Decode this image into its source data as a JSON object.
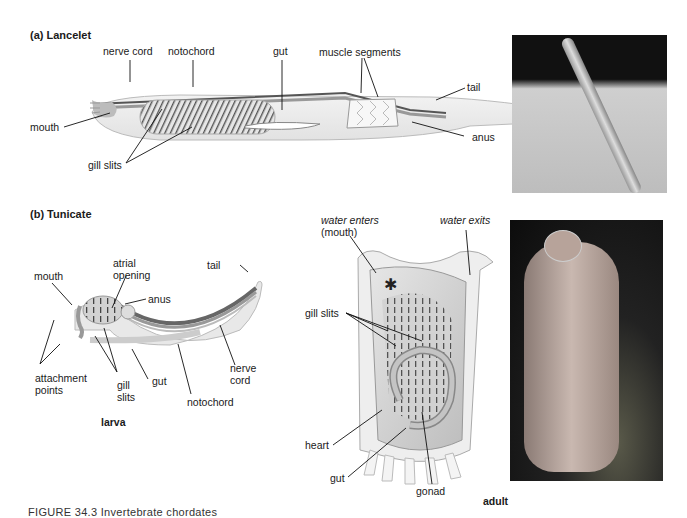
{
  "panel_a": {
    "title": "(a)  Lancelet",
    "labels": {
      "nerve_cord": "nerve cord",
      "notochord": "notochord",
      "gut": "gut",
      "muscle_segments": "muscle segments",
      "tail": "tail",
      "mouth": "mouth",
      "anus": "anus",
      "gill_slits": "gill slits"
    },
    "photo": "lancelet-photo"
  },
  "panel_b": {
    "title": "(b)  Tunicate",
    "larva": {
      "caption": "larva",
      "labels": {
        "mouth": "mouth",
        "atrial_opening_1": "atrial",
        "atrial_opening_2": "opening",
        "anus": "anus",
        "tail": "tail",
        "attachment_points_1": "attachment",
        "attachment_points_2": "points",
        "gill_slits_1": "gill",
        "gill_slits_2": "slits",
        "gut": "gut",
        "nerve_cord_1": "nerve",
        "nerve_cord_2": "cord",
        "notochord": "notochord"
      }
    },
    "adult": {
      "caption": "adult",
      "labels": {
        "water_enters": "water enters",
        "mouth": "(mouth)",
        "water_exits": "water exits",
        "gill_slits": "gill slits",
        "heart": "heart",
        "gut": "gut",
        "gonad": "gonad"
      }
    },
    "photo": "tunicate-photo"
  },
  "figure_caption": "FIGURE 34.3  Invertebrate chordates"
}
